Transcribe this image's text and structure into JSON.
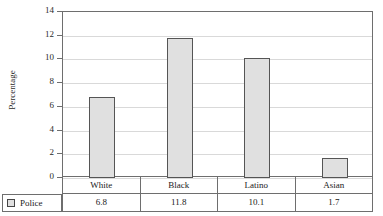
{
  "chart_data": {
    "type": "bar",
    "title": "",
    "subtitle": "",
    "xlabel": "",
    "ylabel": "Percentage",
    "categories": [
      "White",
      "Black",
      "Latino",
      "Asian"
    ],
    "series": [
      {
        "name": "Police",
        "values": [
          6.8,
          11.8,
          10.1,
          1.7
        ],
        "value_labels": [
          "6.8",
          "11.8",
          "10.1",
          "1.7"
        ],
        "fill_color": "#e0e0e0",
        "edge_color": "#555555"
      }
    ],
    "ylim": [
      0,
      14
    ],
    "y_ticks": [
      0,
      2,
      4,
      6,
      8,
      10,
      12,
      14
    ],
    "y_tick_labels": [
      "0",
      "2",
      "4",
      "6",
      "8",
      "10",
      "12",
      "14"
    ],
    "grid": true,
    "grid_axis": "y",
    "grid_color": "#d9d9d9",
    "legend_position": "bottom-left-table",
    "has_data_table": true,
    "frame_color": "#6e6e6e",
    "background_color": "#ffffff"
  },
  "axis": {
    "y_title": "Percentage",
    "ticks": [
      {
        "label": "14"
      },
      {
        "label": "12"
      },
      {
        "label": "10"
      },
      {
        "label": "8"
      },
      {
        "label": "6"
      },
      {
        "label": "4"
      },
      {
        "label": "2"
      },
      {
        "label": "0"
      }
    ]
  },
  "table": {
    "legend": {
      "swatch_color": "#e0e0e0",
      "label": "Police"
    },
    "category_row": [
      "White",
      "Black",
      "Latino",
      "Asian"
    ],
    "value_row": [
      "6.8",
      "11.8",
      "10.1",
      "1.7"
    ]
  }
}
